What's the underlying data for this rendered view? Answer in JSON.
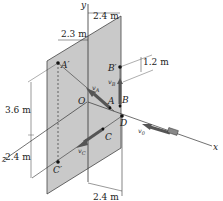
{
  "diagram": {
    "axes": {
      "x": "x",
      "y": "y",
      "z": "z"
    },
    "points": {
      "O": "O",
      "A": "A",
      "A_prime": "A′",
      "B": "B",
      "B_prime": "B′",
      "C": "C",
      "C_prime": "C′",
      "D": "D"
    },
    "velocities": {
      "vA": "v",
      "vA_sub": "A",
      "vB": "v",
      "vB_sub": "B",
      "vC": "v",
      "vC_sub": "C",
      "v0": "v",
      "v0_sub": "0"
    },
    "dimensions": {
      "top_right": "2.4 m",
      "top_left": "2.3 m",
      "right_small": "1.2 m",
      "left_upper": "3.6 m",
      "left_lower": "2.4 m",
      "bottom": "2.4 m"
    },
    "colors": {
      "plate": "#c9c9c9",
      "plate_edge": "#444444",
      "arrow": "#555555",
      "line": "#333333"
    }
  }
}
